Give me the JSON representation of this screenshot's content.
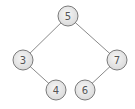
{
  "diagram": {
    "type": "binary-search-tree",
    "nodes": [
      {
        "id": "n5",
        "label": "5"
      },
      {
        "id": "n3",
        "label": "3"
      },
      {
        "id": "n7",
        "label": "7"
      },
      {
        "id": "n4",
        "label": "4"
      },
      {
        "id": "n6",
        "label": "6"
      }
    ],
    "edges": [
      {
        "from": "n5",
        "to": "n3"
      },
      {
        "from": "n5",
        "to": "n7"
      },
      {
        "from": "n3",
        "to": "n4"
      },
      {
        "from": "n7",
        "to": "n6"
      }
    ],
    "colors": {
      "node_fill_light": "#f4f4f4",
      "node_fill_dark": "#dcdcdc",
      "node_stroke": "#7a7a7a",
      "edge": "#8a8a8a",
      "label": "#555555"
    }
  }
}
